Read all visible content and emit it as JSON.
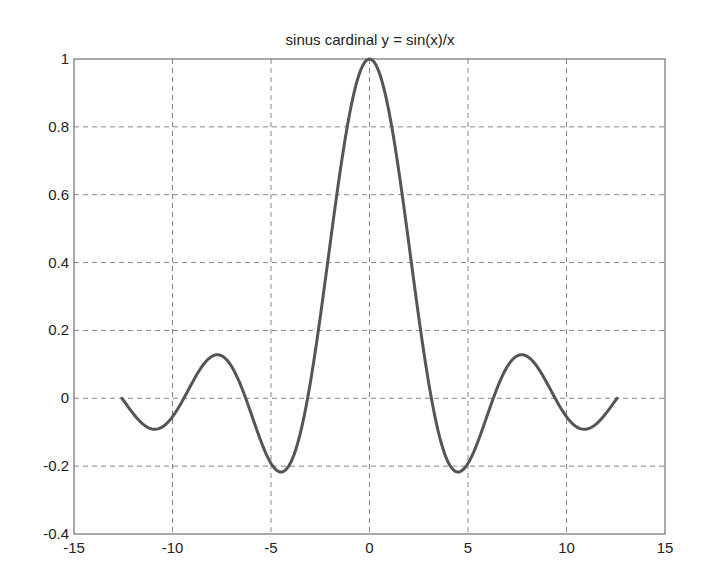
{
  "chart_data": {
    "type": "line",
    "title": "sinus cardinal y = sin(x)/x",
    "xlabel": "",
    "ylabel": "",
    "xlim": [
      -15,
      15
    ],
    "ylim": [
      -0.4,
      1
    ],
    "grid": true,
    "legend": null,
    "x_ticks": [
      -15,
      -10,
      -5,
      0,
      5,
      10,
      15
    ],
    "x_tick_labels": [
      "-15",
      "-10",
      "-5",
      "0",
      "5",
      "10",
      "15"
    ],
    "y_ticks": [
      -0.4,
      -0.2,
      0,
      0.2,
      0.4,
      0.6,
      0.8,
      1
    ],
    "y_tick_labels": [
      "-0.4",
      "-0.2",
      "0",
      "0.2",
      "0.4",
      "0.6",
      "0.8",
      "1"
    ],
    "series": [
      {
        "name": "y = sin(x)/x",
        "color": "#555555",
        "x_range": [
          -12.566,
          12.566
        ],
        "key_points": [
          {
            "x": -12.57,
            "y": 0.0
          },
          {
            "x": -10.9,
            "y": -0.091
          },
          {
            "x": -9.42,
            "y": 0.0
          },
          {
            "x": -7.73,
            "y": 0.128
          },
          {
            "x": -6.28,
            "y": 0.0
          },
          {
            "x": -4.49,
            "y": -0.217
          },
          {
            "x": -3.14,
            "y": 0.0
          },
          {
            "x": 0,
            "y": 1.0
          },
          {
            "x": 3.14,
            "y": 0.0
          },
          {
            "x": 4.49,
            "y": -0.217
          },
          {
            "x": 6.28,
            "y": 0.0
          },
          {
            "x": 7.73,
            "y": 0.128
          },
          {
            "x": 9.42,
            "y": 0.0
          },
          {
            "x": 10.9,
            "y": -0.091
          },
          {
            "x": 12.57,
            "y": 0.0
          }
        ]
      }
    ]
  },
  "colors": {
    "curve": "#555555",
    "axes": "#555555",
    "grid": "#888888",
    "text": "#222222"
  }
}
